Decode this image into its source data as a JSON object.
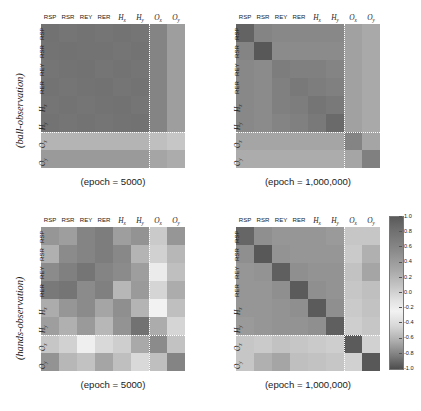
{
  "figure": {
    "type": "correlation-matrix-heatmap-grid",
    "background": "#ffffff",
    "row_axis_labels": [
      "(ball-observation)",
      "(hands-observation)"
    ]
  },
  "axis_labels": {
    "ball_observation": "(ball-observation)",
    "hands_observation": "(hands-observation)"
  },
  "variables": [
    "RSP",
    "RSR",
    "REY",
    "RER",
    "Hx",
    "Hy",
    "Ox",
    "Oy"
  ],
  "variable_display": [
    {
      "text": "RSP",
      "math": false
    },
    {
      "text": "RSR",
      "math": false
    },
    {
      "text": "REY",
      "math": false
    },
    {
      "text": "RER",
      "math": false
    },
    {
      "text": "H",
      "sub": "x",
      "math": true
    },
    {
      "text": "H",
      "sub": "y",
      "math": true
    },
    {
      "text": "O",
      "sub": "x",
      "math": true
    },
    {
      "text": "O",
      "sub": "y",
      "math": true
    }
  ],
  "captions": {
    "epoch_5000": "(epoch = 5000)",
    "epoch_1000000": "(epoch = 1,000,000)"
  },
  "colorbar": {
    "vmin": -1.0,
    "vmax": 1.0,
    "cmap": "gray-diverging",
    "ticks": [
      "1.0",
      "0.8",
      "0.6",
      "0.4",
      "0.2",
      "0.0",
      "-0.2",
      "-0.4",
      "-0.6",
      "-0.8",
      "-1.0"
    ],
    "tick_values": [
      1.0,
      0.8,
      0.6,
      0.4,
      0.2,
      0.0,
      -0.2,
      -0.4,
      -0.6,
      -0.8,
      -1.0
    ],
    "position": "right"
  },
  "separator": {
    "style": "dotted",
    "color": "#ffffff",
    "after_index": 6
  },
  "chart_data": [
    {
      "type": "heatmap",
      "panel": "top-left",
      "title": "(epoch = 5000)",
      "row_group": "(ball-observation)",
      "xlabel": "",
      "ylabel": "",
      "categories_x": [
        "RSP",
        "RSR",
        "REY",
        "RER",
        "Hx",
        "Hy",
        "Ox",
        "Oy"
      ],
      "categories_y": [
        "RSP",
        "RSR",
        "REY",
        "RER",
        "Hx",
        "Hy",
        "Ox",
        "Oy"
      ],
      "zlim": [
        -1.0,
        1.0
      ],
      "values": [
        [
          -0.72,
          -0.7,
          -0.71,
          -0.7,
          -0.71,
          -0.7,
          -0.62,
          -0.48
        ],
        [
          -0.71,
          -0.72,
          -0.71,
          -0.71,
          -0.7,
          -0.71,
          -0.62,
          -0.48
        ],
        [
          -0.7,
          -0.71,
          -0.72,
          -0.7,
          -0.71,
          -0.7,
          -0.62,
          -0.48
        ],
        [
          -0.71,
          -0.7,
          -0.71,
          -0.72,
          -0.7,
          -0.71,
          -0.62,
          -0.48
        ],
        [
          -0.7,
          -0.71,
          -0.7,
          -0.71,
          -0.72,
          -0.7,
          -0.62,
          -0.48
        ],
        [
          -0.71,
          -0.7,
          -0.71,
          -0.7,
          -0.71,
          -0.72,
          -0.62,
          -0.48
        ],
        [
          -0.36,
          -0.36,
          -0.36,
          -0.36,
          -0.36,
          -0.36,
          -0.3,
          -0.26
        ],
        [
          -0.5,
          -0.5,
          -0.5,
          -0.5,
          -0.5,
          -0.5,
          -0.44,
          -0.4
        ]
      ]
    },
    {
      "type": "heatmap",
      "panel": "top-right",
      "title": "(epoch = 1,000,000)",
      "row_group": "(ball-observation)",
      "xlabel": "",
      "ylabel": "",
      "categories_x": [
        "RSP",
        "RSR",
        "REY",
        "RER",
        "Hx",
        "Hy",
        "Ox",
        "Oy"
      ],
      "categories_y": [
        "RSP",
        "RSR",
        "REY",
        "RER",
        "Hx",
        "Hy",
        "Ox",
        "Oy"
      ],
      "zlim": [
        -1.0,
        1.0
      ],
      "values": [
        [
          -0.8,
          -0.62,
          -0.6,
          -0.6,
          -0.6,
          -0.6,
          -0.46,
          -0.42
        ],
        [
          -0.62,
          -0.86,
          -0.58,
          -0.58,
          -0.58,
          -0.58,
          -0.46,
          -0.42
        ],
        [
          -0.6,
          -0.58,
          -0.66,
          -0.64,
          -0.64,
          -0.62,
          -0.46,
          -0.42
        ],
        [
          -0.6,
          -0.58,
          -0.64,
          -0.68,
          -0.66,
          -0.64,
          -0.46,
          -0.42
        ],
        [
          -0.6,
          -0.58,
          -0.64,
          -0.66,
          -0.7,
          -0.68,
          -0.46,
          -0.42
        ],
        [
          -0.6,
          -0.58,
          -0.62,
          -0.64,
          -0.68,
          -0.76,
          -0.46,
          -0.42
        ],
        [
          -0.44,
          -0.44,
          -0.44,
          -0.44,
          -0.44,
          -0.44,
          -0.62,
          -0.44
        ],
        [
          -0.4,
          -0.4,
          -0.4,
          -0.4,
          -0.4,
          -0.4,
          -0.44,
          -0.64
        ]
      ]
    },
    {
      "type": "heatmap",
      "panel": "bottom-left",
      "title": "(epoch = 5000)",
      "row_group": "(hands-observation)",
      "xlabel": "",
      "ylabel": "",
      "categories_x": [
        "RSP",
        "RSR",
        "REY",
        "RER",
        "Hx",
        "Hy",
        "Ox",
        "Oy"
      ],
      "categories_y": [
        "RSP",
        "RSR",
        "REY",
        "RER",
        "Hx",
        "Hy",
        "Ox",
        "Oy"
      ],
      "zlim": [
        -1.0,
        1.0
      ],
      "values": [
        [
          -0.52,
          -0.48,
          -0.62,
          -0.66,
          -0.48,
          -0.54,
          0.24,
          0.52
        ],
        [
          -0.38,
          -0.58,
          -0.62,
          -0.66,
          -0.6,
          -0.36,
          -0.2,
          0.34
        ],
        [
          -0.58,
          -0.64,
          -0.7,
          -0.62,
          -0.58,
          -0.48,
          -0.06,
          0.3
        ],
        [
          -0.68,
          -0.7,
          -0.58,
          -0.64,
          -0.34,
          -0.5,
          0.18,
          0.4
        ],
        [
          -0.4,
          -0.52,
          -0.58,
          -0.44,
          -0.56,
          -0.36,
          0.02,
          0.3
        ],
        [
          -0.48,
          -0.38,
          -0.5,
          -0.34,
          -0.54,
          -0.72,
          0.4,
          0.18
        ],
        [
          0.26,
          -0.2,
          -0.04,
          0.16,
          -0.22,
          0.42,
          -0.58,
          -0.28
        ],
        [
          0.54,
          0.34,
          0.28,
          0.44,
          0.3,
          0.16,
          -0.3,
          -0.62
        ]
      ]
    },
    {
      "type": "heatmap",
      "panel": "bottom-right",
      "title": "(epoch = 1,000,000)",
      "row_group": "(hands-observation)",
      "xlabel": "",
      "ylabel": "",
      "categories_x": [
        "RSP",
        "RSR",
        "REY",
        "RER",
        "Hx",
        "Hy",
        "Ox",
        "Oy"
      ],
      "categories_y": [
        "RSP",
        "RSR",
        "REY",
        "RER",
        "Hx",
        "Hy",
        "Ox",
        "Oy"
      ],
      "zlim": [
        -1.0,
        1.0
      ],
      "values": [
        [
          -0.78,
          -0.56,
          -0.52,
          -0.52,
          -0.52,
          -0.5,
          0.26,
          0.26
        ],
        [
          -0.56,
          -0.86,
          -0.54,
          -0.52,
          -0.52,
          -0.52,
          0.24,
          0.38
        ],
        [
          -0.52,
          -0.54,
          -0.82,
          -0.56,
          -0.54,
          -0.54,
          0.28,
          0.44
        ],
        [
          -0.52,
          -0.52,
          -0.56,
          -0.84,
          -0.56,
          -0.54,
          0.26,
          0.3
        ],
        [
          -0.52,
          -0.52,
          -0.54,
          -0.56,
          -0.84,
          -0.56,
          0.24,
          0.28
        ],
        [
          -0.5,
          -0.52,
          -0.54,
          -0.54,
          -0.56,
          -0.82,
          0.22,
          0.26
        ],
        [
          0.26,
          0.24,
          0.28,
          0.26,
          0.24,
          0.22,
          -0.84,
          0.2
        ],
        [
          0.26,
          0.38,
          0.44,
          0.3,
          0.28,
          0.26,
          0.2,
          -0.86
        ]
      ]
    }
  ]
}
